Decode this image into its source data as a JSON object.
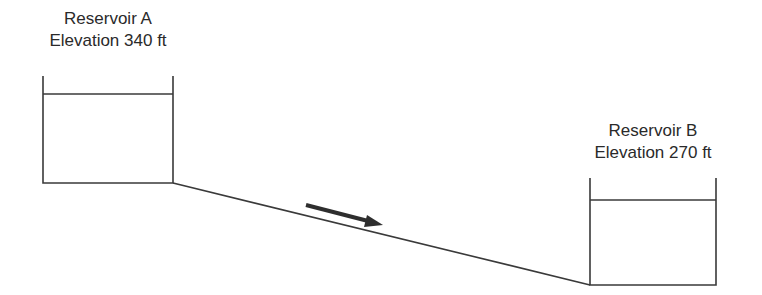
{
  "reservoir_a": {
    "name": "Reservoir A",
    "elevation": "Elevation 340 ft"
  },
  "reservoir_b": {
    "name": "Reservoir B",
    "elevation": "Elevation 270 ft"
  },
  "pipe": {
    "flow_direction": "A to B",
    "arrow_icon": "right-arrow-icon"
  },
  "colors": {
    "line": "#3a3a3a",
    "text": "#2a2a2a",
    "background": "#ffffff"
  }
}
